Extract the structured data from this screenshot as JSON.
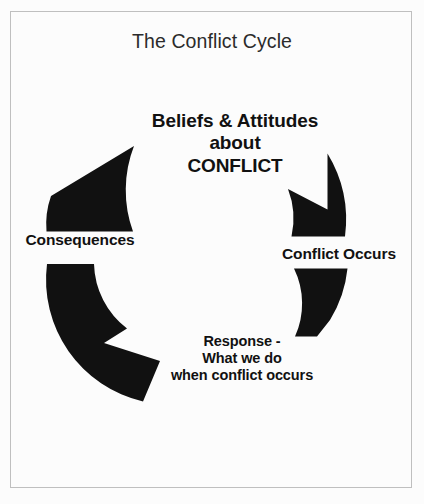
{
  "page": {
    "title": "The Conflict Cycle",
    "background_color": "#fcfcfc",
    "border_color": "#bfbfbf",
    "shape_color": "#111111"
  },
  "diagram": {
    "type": "cycle",
    "direction": "clockwise",
    "segment_count": 4,
    "center_label": "Beliefs & Attitudes\nabout\nCONFLICT",
    "nodes": [
      {
        "id": "conflict-occurs",
        "label": "Conflict Occurs",
        "position": "right"
      },
      {
        "id": "response",
        "label": "Response -\nWhat we do\nwhen conflict occurs",
        "position": "bottom"
      },
      {
        "id": "consequences",
        "label": "Consequences",
        "position": "left"
      }
    ]
  }
}
